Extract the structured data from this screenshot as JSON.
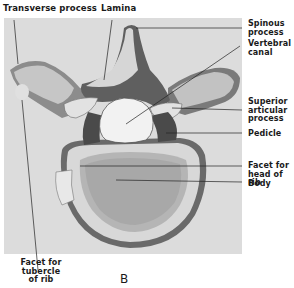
{
  "figure": {
    "panel_label": "B",
    "labels": {
      "transverse_process": "Transverse process",
      "lamina": "Lamina",
      "spinous_process": "Spinous\nprocess",
      "vertebral_canal": "Vertebral\ncanal",
      "superior_articular_process": "Superior\narticular\nprocess",
      "pedicle": "Pedicle",
      "facet_head_of_rib": "Facet for\nhead of rib",
      "body": "Body",
      "facet_tubercle_of_rib": "Facet for\ntubercle\nof rib"
    }
  }
}
